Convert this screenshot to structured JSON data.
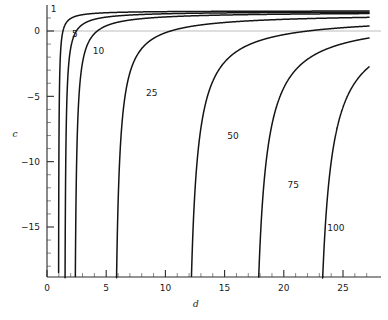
{
  "chart_data": {
    "type": "line",
    "title": "",
    "xlabel": "d",
    "ylabel": "c",
    "xlim": [
      0,
      27.2
    ],
    "ylim": [
      -18.5,
      2.2
    ],
    "grid": false,
    "legend": null,
    "x_ticks_major": [
      0,
      5,
      10,
      15,
      20,
      25
    ],
    "x_tick_labels": [
      "0",
      "5",
      "10",
      "15",
      "20",
      "25"
    ],
    "y_ticks_major": [
      0,
      -5,
      -10,
      -15
    ],
    "y_tick_labels": [
      "0",
      "-5",
      "-10",
      "-15"
    ],
    "x_minor_step": 1,
    "y_minor_step": 1,
    "zero_reference_line_y": 0,
    "annotations": [
      {
        "text": "1",
        "x": 0.55,
        "y": 1.45
      },
      {
        "text": "5",
        "x": 2.35,
        "y": -0.45
      },
      {
        "text": "10",
        "x": 4.35,
        "y": -1.75
      },
      {
        "text": "25",
        "x": 8.85,
        "y": -4.95
      },
      {
        "text": "50",
        "x": 15.7,
        "y": -8.25
      },
      {
        "text": "75",
        "x": 20.8,
        "y": -12.0
      },
      {
        "text": "100",
        "x": 24.4,
        "y": -15.3
      }
    ],
    "series": [
      {
        "name": "1",
        "label": "1",
        "asymptote_d": 0.95,
        "asymptote_c": 1.55,
        "scale": 0.62,
        "d_end": 27.2
      },
      {
        "name": "5",
        "label": "5",
        "asymptote_d": 1.45,
        "asymptote_c": 1.5,
        "scale": 1.55,
        "d_end": 27.2
      },
      {
        "name": "10",
        "label": "10",
        "asymptote_d": 2.25,
        "asymptote_c": 1.45,
        "scale": 2.9,
        "d_end": 27.2
      },
      {
        "name": "25",
        "label": "25",
        "asymptote_d": 5.55,
        "asymptote_c": 1.35,
        "scale": 6.6,
        "d_end": 27.2
      },
      {
        "name": "50",
        "label": "50",
        "asymptote_d": 11.6,
        "asymptote_c": 1.15,
        "scale": 12.0,
        "d_end": 27.2
      },
      {
        "name": "75",
        "label": "75",
        "asymptote_d": 17.1,
        "asymptote_c": 1.0,
        "scale": 15.5,
        "d_end": 27.2
      },
      {
        "name": "100",
        "label": "100",
        "asymptote_d": 22.4,
        "asymptote_c": 0.9,
        "scale": 17.5,
        "d_end": 27.2
      }
    ]
  }
}
